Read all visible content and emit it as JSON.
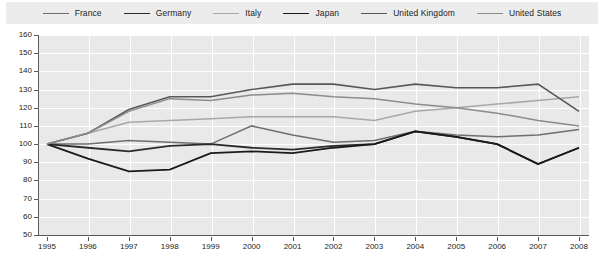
{
  "chart_data": {
    "type": "line",
    "title": "",
    "subtitle": "",
    "xlabel": "",
    "ylabel": "",
    "x": [
      1995,
      1996,
      1997,
      1998,
      1999,
      2000,
      2001,
      2002,
      2003,
      2004,
      2005,
      2006,
      2007,
      2008
    ],
    "xticklabels": [
      "1995",
      "1996",
      "1997",
      "1998",
      "1999",
      "2000",
      "2001",
      "2002",
      "2003",
      "2004",
      "2005",
      "2006",
      "2007",
      "2008"
    ],
    "yticks": [
      50,
      60,
      70,
      80,
      90,
      100,
      110,
      120,
      130,
      140,
      150,
      160
    ],
    "yticklabels": [
      "50",
      "60",
      "70",
      "80",
      "90",
      "100",
      "110",
      "120",
      "130",
      "140",
      "150",
      "160"
    ],
    "ylim": [
      50,
      160
    ],
    "xlim": [
      1995,
      2008
    ],
    "grid": true,
    "legend_position": "top",
    "index_base": 100,
    "series": [
      {
        "name": "France",
        "color": "#6e6e6e",
        "width": 1.5,
        "values": [
          100,
          100,
          102,
          101,
          100,
          110,
          105,
          101,
          102,
          107,
          105,
          104,
          105,
          108
        ]
      },
      {
        "name": "Germany",
        "color": "#2b2b2b",
        "width": 1.8,
        "values": [
          100,
          98,
          96,
          99,
          100,
          98,
          97,
          99,
          100,
          107,
          104,
          100,
          89,
          98
        ]
      },
      {
        "name": "Italy",
        "color": "#a8a8a8",
        "width": 1.5,
        "values": [
          100,
          106,
          112,
          113,
          114,
          115,
          115,
          115,
          113,
          118,
          120,
          122,
          124,
          126
        ]
      },
      {
        "name": "Japan",
        "color": "#1a1a1a",
        "width": 1.8,
        "values": [
          100,
          92,
          85,
          86,
          95,
          96,
          95,
          98,
          100,
          107,
          104,
          100,
          89,
          98
        ]
      },
      {
        "name": "United Kingdom",
        "color": "#585858",
        "width": 1.6,
        "values": [
          100,
          106,
          119,
          126,
          126,
          130,
          133,
          133,
          130,
          133,
          131,
          131,
          133,
          118
        ]
      },
      {
        "name": "United States",
        "color": "#8c8c8c",
        "width": 1.5,
        "values": [
          100,
          106,
          118,
          125,
          124,
          127,
          128,
          126,
          125,
          122,
          120,
          117,
          113,
          110
        ]
      }
    ]
  },
  "legend": {
    "items": [
      {
        "label": "France"
      },
      {
        "label": "Germany"
      },
      {
        "label": "Italy"
      },
      {
        "label": "Japan"
      },
      {
        "label": "United Kingdom"
      },
      {
        "label": "United States"
      }
    ]
  }
}
